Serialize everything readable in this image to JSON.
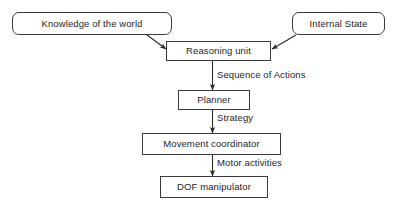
{
  "diagram": {
    "background_color": "#ffffff",
    "stroke_color": "#3a3a3a",
    "text_color": "#1e1e1e",
    "nodes": [
      {
        "id": "knowledge",
        "label": "Knowledge of the world",
        "shape": "rounded-rectangle",
        "x": 12,
        "y": 12,
        "w": 160,
        "h": 23
      },
      {
        "id": "internal_state",
        "label": "Internal State",
        "shape": "rounded-rectangle",
        "x": 292,
        "y": 12,
        "w": 93,
        "h": 23
      },
      {
        "id": "reasoning_unit",
        "label": "Reasoning unit",
        "shape": "rectangle",
        "x": 166,
        "y": 41,
        "w": 105,
        "h": 20
      },
      {
        "id": "planner",
        "label": "Planner",
        "shape": "rectangle",
        "x": 178,
        "y": 90,
        "w": 72,
        "h": 20
      },
      {
        "id": "movement_coordinator",
        "label": "Movement coordinator",
        "shape": "rectangle",
        "x": 142,
        "y": 133,
        "w": 139,
        "h": 22
      },
      {
        "id": "dof_manipulator",
        "label": "DOF manipulator",
        "shape": "rectangle",
        "x": 160,
        "y": 176,
        "w": 108,
        "h": 22
      }
    ],
    "edges": [
      {
        "id": "knowledge_to_reasoning",
        "from": "knowledge",
        "to": "reasoning_unit",
        "label": "",
        "style": "diagonal-arrow"
      },
      {
        "id": "internal_state_to_reasoning",
        "from": "internal_state",
        "to": "reasoning_unit",
        "label": "",
        "style": "diagonal-arrow"
      },
      {
        "id": "reasoning_to_planner",
        "from": "reasoning_unit",
        "to": "planner",
        "label": "Sequence of Actions",
        "style": "vertical-arrow"
      },
      {
        "id": "planner_to_movement",
        "from": "planner",
        "to": "movement_coordinator",
        "label": "Strategy",
        "style": "vertical-arrow"
      },
      {
        "id": "movement_to_dof",
        "from": "movement_coordinator",
        "to": "dof_manipulator",
        "label": "Motor activities",
        "style": "vertical-arrow"
      }
    ],
    "edge_labels": [
      {
        "id": "label_sequence",
        "text": "Sequence of Actions",
        "x": 217,
        "y": 70
      },
      {
        "id": "label_strategy",
        "text": "Strategy",
        "x": 217,
        "y": 113
      },
      {
        "id": "label_motor",
        "text": "Motor activities",
        "x": 217,
        "y": 158
      }
    ]
  }
}
